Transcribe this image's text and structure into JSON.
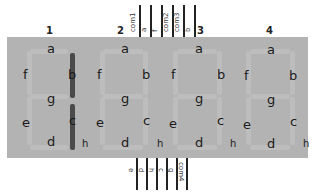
{
  "diagram": {
    "digits": [
      {
        "number": "1",
        "lit_segments": [
          "b",
          "c"
        ]
      },
      {
        "number": "2",
        "lit_segments": []
      },
      {
        "number": "3",
        "lit_segments": []
      },
      {
        "number": "4",
        "lit_segments": []
      }
    ],
    "segment_labels": {
      "a": "a",
      "b": "b",
      "c": "c",
      "d": "d",
      "e": "e",
      "f": "f",
      "g": "g",
      "h": "h"
    },
    "top_pins": [
      "com1",
      "a",
      "f",
      "com2",
      "com3",
      "b"
    ],
    "bottom_pins": [
      "e",
      "d",
      "h",
      "c",
      "g",
      "com4"
    ],
    "colors": {
      "panel": "#b3b3b3",
      "lit_segment": "#4a4a4a",
      "pin": "#222222"
    }
  }
}
